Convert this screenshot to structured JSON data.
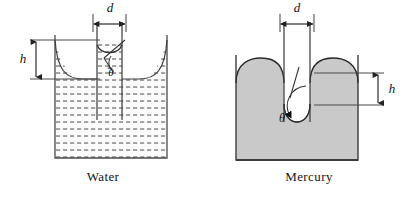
{
  "figure": {
    "background": "#ffffff",
    "width": 412,
    "height": 201
  },
  "panels": [
    {
      "id": "water",
      "caption": "Water",
      "liquid_name": "water",
      "fill_style": "dotted-hatch",
      "fill_color": "#f2f2f2",
      "dot_color": "#6d6d6d",
      "outline_color": "#4a4a4a",
      "meniscus": "concave",
      "rise_direction": "up",
      "labels": {
        "diameter": "d",
        "height": "h",
        "contact_angle": "θ"
      },
      "contact_angle_note": "small (wetting)",
      "tube": {
        "left_x": 97,
        "right_x": 122,
        "top_y": 22
      },
      "vessel": {
        "left_x": 55,
        "right_x": 167,
        "top_y": 35,
        "bottom_y": 158
      }
    },
    {
      "id": "mercury",
      "caption": "Mercury",
      "liquid_name": "mercury",
      "fill_style": "solid",
      "fill_color": "#c9c9c9",
      "dot_color": "#c9c9c9",
      "outline_color": "#3d3d3d",
      "meniscus": "convex",
      "rise_direction": "down",
      "labels": {
        "diameter": "d",
        "height": "h",
        "contact_angle": "θ"
      },
      "contact_angle_note": "large (non-wetting)",
      "tube": {
        "left_x": 78,
        "right_x": 104,
        "top_y": 22
      },
      "vessel": {
        "left_x": 30,
        "right_x": 152,
        "top_y": 55,
        "bottom_y": 160
      }
    }
  ],
  "colors": {
    "ink": "#1a1a1a",
    "rule": "#4a4a4a",
    "mercury_gray": "#c9c9c9",
    "water_tint": "#f4f4f4",
    "page": "#ffffff"
  }
}
